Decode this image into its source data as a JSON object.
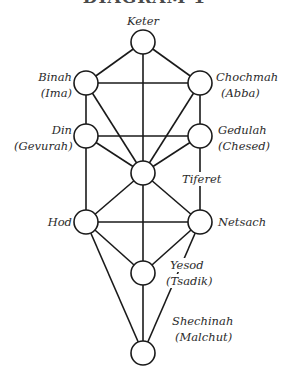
{
  "diagram": {
    "title": "DIAGRAM 1",
    "colors": {
      "line": "#1a1a1a",
      "node_fill": "#ffffff",
      "text": "#2b2b2b",
      "background": "#ffffff"
    },
    "nodes": [
      {
        "id": "keter",
        "label": "Keter",
        "sublabel": "",
        "x": 143,
        "y": 42
      },
      {
        "id": "binah",
        "label": "Binah",
        "sublabel": "(Ima)",
        "x": 86,
        "y": 83
      },
      {
        "id": "chochmah",
        "label": "Chochmah",
        "sublabel": "(Abba)",
        "x": 200,
        "y": 83
      },
      {
        "id": "din",
        "label": "Din",
        "sublabel": "(Gevurah)",
        "x": 86,
        "y": 136
      },
      {
        "id": "gedulah",
        "label": "Gedulah",
        "sublabel": "(Chesed)",
        "x": 200,
        "y": 136
      },
      {
        "id": "tiferet",
        "label": "Tiferet",
        "sublabel": "",
        "x": 143,
        "y": 173
      },
      {
        "id": "hod",
        "label": "Hod",
        "sublabel": "",
        "x": 86,
        "y": 222
      },
      {
        "id": "netsach",
        "label": "Netsach",
        "sublabel": "",
        "x": 200,
        "y": 222
      },
      {
        "id": "yesod",
        "label": "Yesod",
        "sublabel": "(Tsadik)",
        "x": 143,
        "y": 273
      },
      {
        "id": "shechinah",
        "label": "Shechinah",
        "sublabel": "(Malchut)",
        "x": 143,
        "y": 353
      }
    ],
    "edges": [
      [
        "keter",
        "binah"
      ],
      [
        "keter",
        "chochmah"
      ],
      [
        "keter",
        "tiferet"
      ],
      [
        "binah",
        "chochmah"
      ],
      [
        "binah",
        "din"
      ],
      [
        "binah",
        "tiferet"
      ],
      [
        "chochmah",
        "gedulah"
      ],
      [
        "chochmah",
        "tiferet"
      ],
      [
        "din",
        "gedulah"
      ],
      [
        "din",
        "tiferet"
      ],
      [
        "din",
        "hod"
      ],
      [
        "gedulah",
        "tiferet"
      ],
      [
        "gedulah",
        "netsach"
      ],
      [
        "tiferet",
        "hod"
      ],
      [
        "tiferet",
        "netsach"
      ],
      [
        "tiferet",
        "yesod"
      ],
      [
        "hod",
        "netsach"
      ],
      [
        "hod",
        "yesod"
      ],
      [
        "hod",
        "shechinah"
      ],
      [
        "netsach",
        "yesod"
      ],
      [
        "netsach",
        "shechinah"
      ],
      [
        "yesod",
        "shechinah"
      ]
    ],
    "labels": {
      "keter": "Keter",
      "binah": "Binah",
      "binah_sub": "(Ima)",
      "chochmah": "Chochmah",
      "chochmah_sub": "(Abba)",
      "din": "Din",
      "din_sub": "(Gevurah)",
      "gedulah": "Gedulah",
      "gedulah_sub": "(Chesed)",
      "tiferet": "Tiferet",
      "hod": "Hod",
      "netsach": "Netsach",
      "yesod": "Yesod",
      "yesod_sub": "(Tsadik)",
      "shechinah": "Shechinah",
      "shechinah_sub": "(Malchut)"
    }
  }
}
